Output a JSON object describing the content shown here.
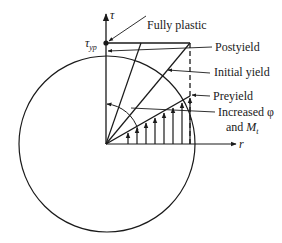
{
  "diagram": {
    "axes": {
      "vertical_label": "τ",
      "horizontal_label": "r",
      "yield_stress_label": "τ",
      "yield_stress_subscript": "yp"
    },
    "labels": {
      "fully_plastic": "Fully plastic",
      "postyield": "Postyield",
      "initial_yield": "Initial yield",
      "preyield": "Preyield",
      "increased_line1": "Increased φ",
      "increased_line2_prefix": "and ",
      "increased_line2_symbol": "M",
      "increased_line2_subscript": "t"
    },
    "colors": {
      "ink": "#1a1a1a",
      "background": "#ffffff"
    }
  }
}
